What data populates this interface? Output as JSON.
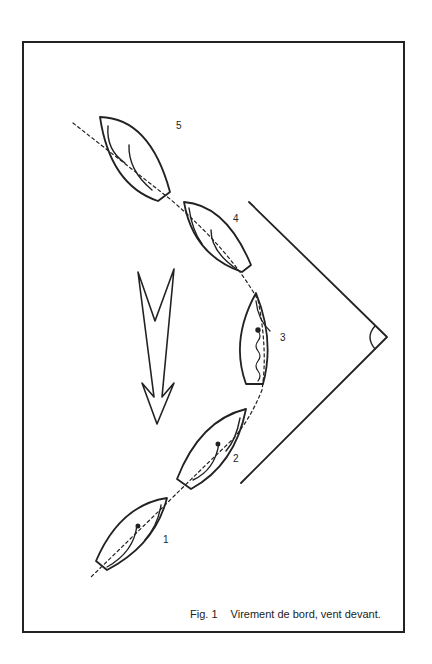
{
  "figure": {
    "number_label": "Fig. 1",
    "caption": "Virement de bord, vent devant.",
    "boat_labels": [
      "1",
      "2",
      "3",
      "4",
      "5"
    ],
    "wind_arrow": "wind-direction-arrow",
    "angle_marker": "right-angle"
  },
  "colors": {
    "ink": "#222222",
    "paper": "#ffffff"
  }
}
